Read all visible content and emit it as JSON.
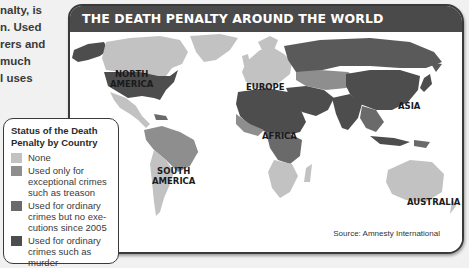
{
  "intro_text_fragment": {
    "lines": [
      "nalty, is",
      "n. Used",
      "rers and",
      "much",
      "l uses"
    ]
  },
  "map": {
    "title": "THE DEATH PENALTY AROUND THE WORLD",
    "source": "Source: Amnesty International",
    "region_labels": {
      "north_america": [
        "NORTH",
        "AMERICA"
      ],
      "south_america": [
        "SOUTH",
        "AMERICA"
      ],
      "europe": "EUROPE",
      "africa": "AFRICA",
      "asia": "ASIA",
      "australia": "AUSTRALIA"
    },
    "colors": {
      "none": "#c2c2c2",
      "exceptional": "#8e8e8e",
      "no_executions": "#6a6a6a",
      "ordinary": "#4d4d4d",
      "ocean": "#ffffff",
      "title_bar": "#4a4a4a"
    }
  },
  "legend": {
    "title_lines": [
      "Status of the Death",
      "Penalty by Country"
    ],
    "items": [
      {
        "label_lines": [
          "None"
        ],
        "color": "#c2c2c2"
      },
      {
        "label_lines": [
          "Used only for",
          "exceptional crimes",
          "such as treason"
        ],
        "color": "#8e8e8e"
      },
      {
        "label_lines": [
          "Used for ordinary",
          "crimes but no exe-",
          "cutions since 2005"
        ],
        "color": "#6a6a6a"
      },
      {
        "label_lines": [
          "Used for ordinary",
          "crimes such as murder"
        ],
        "color": "#4d4d4d"
      }
    ]
  }
}
